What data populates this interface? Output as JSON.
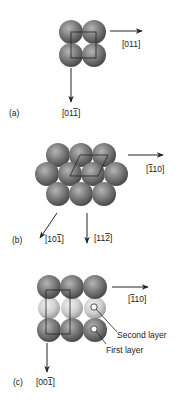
{
  "panels": [
    {
      "id": "a",
      "label": "(a)",
      "arrows": [
        {
          "direction": "right",
          "label_main": "[011]",
          "bar_index": -1
        },
        {
          "direction": "down",
          "label_prefix": "[01",
          "label_bar": "1",
          "label_suffix": "]"
        }
      ]
    },
    {
      "id": "b",
      "label": "(b)",
      "arrows": [
        {
          "direction": "right",
          "label_prefix": "[",
          "label_bar": "1",
          "label_suffix": "10]"
        },
        {
          "direction": "down-left",
          "label_prefix": "[10",
          "label_bar": "1",
          "label_suffix": "]"
        },
        {
          "direction": "down",
          "label_prefix": "[11",
          "label_bar": "2",
          "label_suffix": "]"
        }
      ]
    },
    {
      "id": "c",
      "label": "(c)",
      "arrows": [
        {
          "direction": "right",
          "label_prefix": "[",
          "label_bar": "1",
          "label_suffix": "10]"
        },
        {
          "direction": "down",
          "label_prefix": "[00",
          "label_bar": "1",
          "label_suffix": "]"
        }
      ],
      "annotations": {
        "second_layer": "Second layer",
        "first_layer": "First layer"
      }
    }
  ],
  "colors": {
    "sphere_dark": "#6a6a6a",
    "sphere_light": "#c8c8c8",
    "line": "#222222"
  }
}
